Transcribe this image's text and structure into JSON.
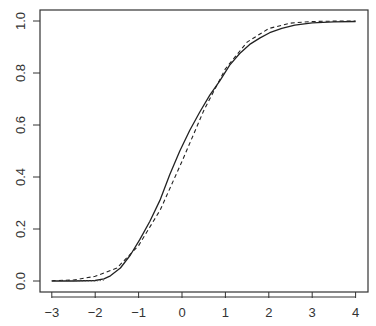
{
  "chart_data": {
    "type": "line",
    "title": "",
    "xlabel": "",
    "ylabel": "",
    "xlim": [
      -3.25,
      4.25
    ],
    "ylim": [
      -0.04,
      1.04
    ],
    "grid": false,
    "legend": null,
    "x_ticks": [
      -3,
      -2,
      -1,
      0,
      1,
      2,
      3,
      4
    ],
    "x_tick_labels": [
      "−3",
      "−2",
      "−1",
      "0",
      "1",
      "2",
      "3",
      "4"
    ],
    "y_ticks": [
      0.0,
      0.2,
      0.4,
      0.6,
      0.8,
      1.0
    ],
    "y_tick_labels": [
      "0.0",
      "0.2",
      "0.4",
      "0.6",
      "0.8",
      "1.0"
    ],
    "series": [
      {
        "name": "solid",
        "style": "solid",
        "color": "#222222",
        "x": [
          -3.0,
          -2.5,
          -2.0,
          -1.8,
          -1.65,
          -1.42,
          -1.19,
          -0.97,
          -0.74,
          -0.51,
          -0.28,
          -0.05,
          0.18,
          0.41,
          0.64,
          0.87,
          1.1,
          1.33,
          1.56,
          1.8,
          2.02,
          2.3,
          2.6,
          3.0,
          3.5,
          4.0
        ],
        "y": [
          0.0,
          0.0,
          0.002,
          0.008,
          0.02,
          0.05,
          0.1,
          0.16,
          0.23,
          0.31,
          0.41,
          0.5,
          0.58,
          0.65,
          0.715,
          0.77,
          0.83,
          0.875,
          0.91,
          0.935,
          0.955,
          0.972,
          0.984,
          0.993,
          0.997,
          0.998
        ]
      },
      {
        "name": "dashed",
        "style": "dashed",
        "color": "#222222",
        "x": [
          -3.0,
          -2.5,
          -2.0,
          -1.5,
          -1.0,
          -0.5,
          0.0,
          0.5,
          1.0,
          1.5,
          2.0,
          2.5,
          3.0,
          3.5,
          4.0
        ],
        "y": [
          0.001,
          0.004,
          0.018,
          0.05,
          0.136,
          0.274,
          0.46,
          0.655,
          0.816,
          0.919,
          0.971,
          0.992,
          0.998,
          0.9997,
          1.0
        ]
      },
      {
        "name": "dotted",
        "style": "dotted",
        "color": "#555555",
        "x": [
          -3.0,
          -2.5,
          -2.0,
          -1.8
        ],
        "y": [
          0.0,
          0.0,
          0.0,
          0.003
        ]
      }
    ]
  }
}
